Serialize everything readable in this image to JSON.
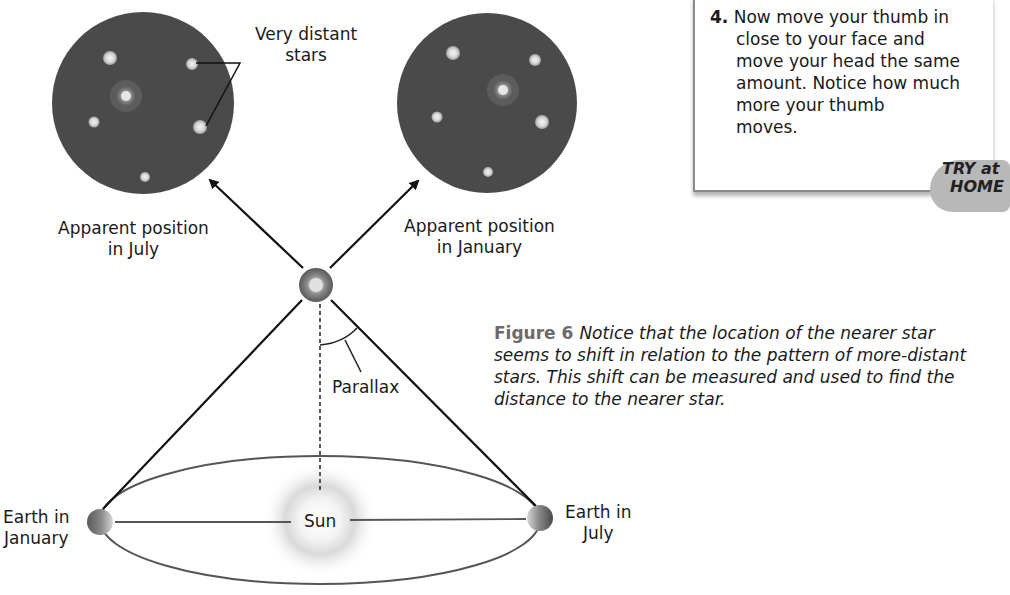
{
  "diagram": {
    "title": "Parallax",
    "labels": {
      "very_distant_stars": [
        "Very distant",
        "stars"
      ],
      "apparent_july": [
        "Apparent position",
        "in July"
      ],
      "apparent_january": [
        "Apparent position",
        "in January"
      ],
      "parallax": "Parallax",
      "sun": "Sun",
      "earth_january": [
        "Earth in",
        "January"
      ],
      "earth_july": [
        "Earth in",
        "July"
      ]
    },
    "colors": {
      "sky_disc": "#4a4a4a",
      "star_glow": "#d8d8d8",
      "line": "#1a1a1a",
      "orbit": "#555555"
    }
  },
  "activity_box": {
    "step_number": "4.",
    "lines": [
      "Now move your thumb in",
      "close to your face and",
      "move your head the same",
      "amount. Notice how much",
      "more your thumb",
      "moves."
    ],
    "badge": [
      "TRY at",
      "HOME"
    ]
  },
  "caption": {
    "figure_label": "Figure 6",
    "text": "Notice that the location of the nearer star seems to shift in relation to the pattern of more-distant stars. This shift can be measured and used to find the distance to the nearer star."
  }
}
